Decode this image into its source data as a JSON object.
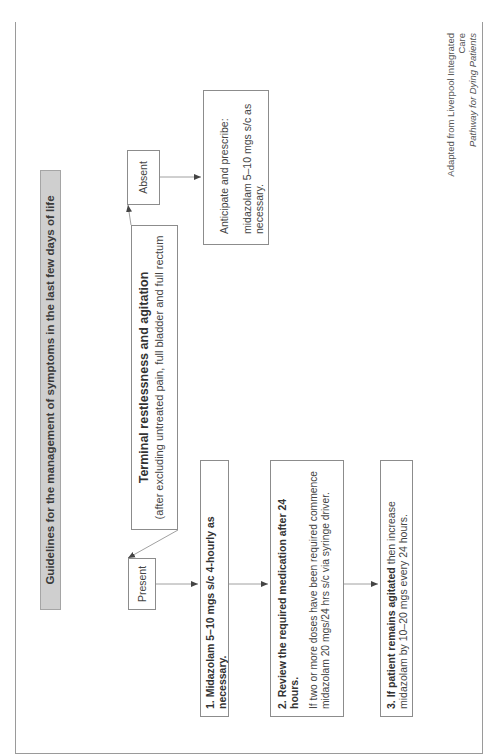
{
  "title": "Guidelines for the management of symptoms in the last few days of life",
  "terminal": {
    "heading": "Terminal restlessness and agitation",
    "subheading": "(after excluding untreated pain, full bladder and full rectum"
  },
  "branches": {
    "absent": "Absent",
    "present": "Present"
  },
  "absent_path": {
    "line1": "Anticipate and prescribe:",
    "line2": "midazolam 5–10 mgs s/c as necessary."
  },
  "present_path": {
    "step1": "1. Midazolam 5–10 mgs s/c 4-hourly as necessary.",
    "step2": {
      "heading": "2. Review the required medication after 24 hours.",
      "body": "If two or more doses have been required commence midazolam 20 mgs/24 hrs s/c via syringe driver."
    },
    "step3": {
      "bold": "3. If patient remains agitated",
      "rest": " then increase midazolam by 10–20 mgs every 24 hours."
    }
  },
  "attribution": {
    "line1": "Adapted from Liverpool Integrated Care",
    "line2": "Pathway for Dying Patients"
  },
  "colors": {
    "title_bar_bg": "#cfcfcf",
    "border": "#8c8c8c",
    "text": "#333333"
  }
}
